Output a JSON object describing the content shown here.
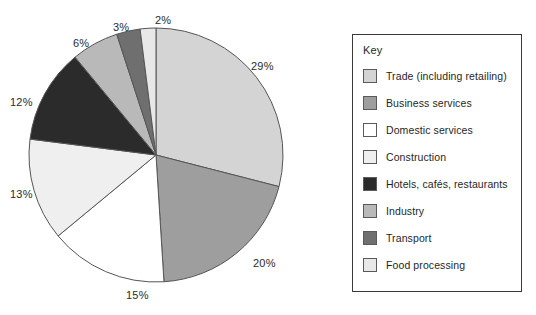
{
  "legend": {
    "title": "Key",
    "items": [
      {
        "label": "Trade (including retailing)",
        "color": "#d4d4d4"
      },
      {
        "label": "Business services",
        "color": "#9e9e9e"
      },
      {
        "label": "Domestic services",
        "color": "#ffffff"
      },
      {
        "label": "Construction",
        "color": "#efefef"
      },
      {
        "label": "Hotels, cafés, restaurants",
        "color": "#2b2b2b"
      },
      {
        "label": "Industry",
        "color": "#b9b9b9"
      },
      {
        "label": "Transport",
        "color": "#6f6f6f"
      },
      {
        "label": "Food processing",
        "color": "#e8e8e8"
      }
    ]
  },
  "chart_data": {
    "type": "pie",
    "title": "",
    "start_angle_deg": 0,
    "direction": "clockwise",
    "labels_suffix": "%",
    "categories": [
      "Trade (including retailing)",
      "Business services",
      "Domestic services",
      "Construction",
      "Hotels, cafés, restaurants",
      "Industry",
      "Transport",
      "Food processing"
    ],
    "values": [
      29,
      20,
      15,
      13,
      12,
      6,
      3,
      2
    ],
    "value_labels": [
      "29%",
      "20%",
      "15%",
      "13%",
      "12%",
      "6%",
      "3%",
      "2%"
    ],
    "colors": [
      "#d4d4d4",
      "#9e9e9e",
      "#ffffff",
      "#efefef",
      "#2b2b2b",
      "#b9b9b9",
      "#6f6f6f",
      "#e8e8e8"
    ],
    "total": 100,
    "legend_position": "right"
  },
  "pct_labels": [
    {
      "text": "29%",
      "x": 251,
      "y": 60
    },
    {
      "text": "20%",
      "x": 253,
      "y": 257
    },
    {
      "text": "15%",
      "x": 126,
      "y": 289
    },
    {
      "text": "13%",
      "x": 10,
      "y": 188
    },
    {
      "text": "12%",
      "x": 10,
      "y": 96
    },
    {
      "text": "6%",
      "x": 73,
      "y": 37
    },
    {
      "text": "3%",
      "x": 113,
      "y": 21
    },
    {
      "text": "2%",
      "x": 155,
      "y": 14
    }
  ]
}
